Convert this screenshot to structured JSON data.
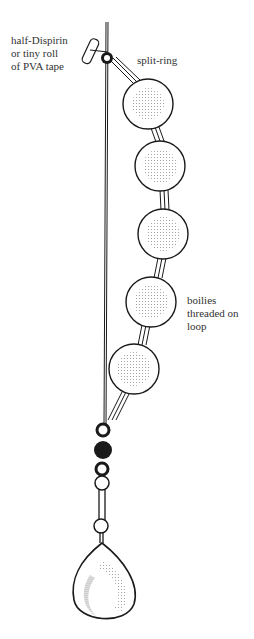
{
  "labels": {
    "dispirin": "half-Dispirin\nor tiny roll\nof PVA tape",
    "split_ring": "split-ring",
    "boilies": "boilies\nthreaded on\nloop"
  },
  "colors": {
    "ink": "#1a1a1a",
    "paper": "#ffffff",
    "stipple": "#888888"
  },
  "boilies": [
    {
      "cx": 148,
      "cy": 104,
      "r": 25
    },
    {
      "cx": 160,
      "cy": 166,
      "r": 25
    },
    {
      "cx": 163,
      "cy": 234,
      "r": 25
    },
    {
      "cx": 151,
      "cy": 302,
      "r": 25
    },
    {
      "cx": 134,
      "cy": 369,
      "r": 25
    }
  ]
}
